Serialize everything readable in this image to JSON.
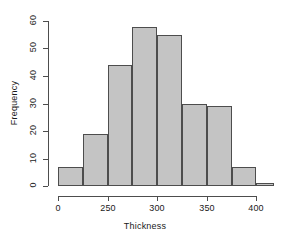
{
  "chart_data": {
    "type": "bar",
    "subtype": "histogram",
    "title": "",
    "xlabel": "Thickness",
    "ylabel": "Frequency",
    "xlim": [
      200,
      400
    ],
    "ylim": [
      0,
      60
    ],
    "xticks": [
      0,
      250,
      300,
      350,
      400
    ],
    "xtick_positions": [
      200,
      250,
      300,
      350,
      400
    ],
    "yticks": [
      0,
      10,
      20,
      30,
      40,
      50,
      60
    ],
    "grid": false,
    "legend": null,
    "bin_width": 25,
    "bin_edges": [
      200,
      225,
      250,
      275,
      300,
      325,
      350,
      375,
      400
    ],
    "categories": [
      "200-225",
      "225-250",
      "250-275",
      "275-300",
      "300-325",
      "325-350",
      "350-375",
      "375-400"
    ],
    "values": [
      7,
      19,
      44,
      58,
      55,
      30,
      29,
      7
    ],
    "tail_bar": {
      "edge_start": 400,
      "edge_end": 418,
      "value": 1
    },
    "bar_fill": "#c4c4c4",
    "bar_stroke": "#4d4d4d",
    "axis_color": "#4d4d4d",
    "text_color": "#1a1a1a"
  },
  "axes": {
    "x_title": "Thickness",
    "y_title": "Frequency"
  },
  "ticks": {
    "x": [
      {
        "label": "0",
        "px": 58
      },
      {
        "label": "250",
        "px": 108
      },
      {
        "label": "300",
        "px": 157
      },
      {
        "label": "350",
        "px": 207
      },
      {
        "label": "400",
        "px": 256
      }
    ],
    "y": [
      {
        "label": "0",
        "px": 186
      },
      {
        "label": "10",
        "px": 159
      },
      {
        "label": "20",
        "px": 131
      },
      {
        "label": "30",
        "px": 104
      },
      {
        "label": "40",
        "px": 76
      },
      {
        "label": "50",
        "px": 48
      },
      {
        "label": "60",
        "px": 21
      }
    ]
  },
  "bars": [
    {
      "name": "bin-1",
      "x0": 58,
      "x1": 83,
      "value": 7
    },
    {
      "name": "bin-2",
      "x0": 83,
      "x1": 108,
      "value": 19
    },
    {
      "name": "bin-3",
      "x0": 108,
      "x1": 132,
      "value": 44
    },
    {
      "name": "bin-4",
      "x0": 132,
      "x1": 157,
      "value": 58
    },
    {
      "name": "bin-5",
      "x0": 157,
      "x1": 182,
      "value": 55
    },
    {
      "name": "bin-6",
      "x0": 182,
      "x1": 207,
      "value": 30
    },
    {
      "name": "bin-7",
      "x0": 207,
      "x1": 232,
      "value": 29
    },
    {
      "name": "bin-8",
      "x0": 232,
      "x1": 256,
      "value": 7
    },
    {
      "name": "bin-9",
      "x0": 256,
      "x1": 274,
      "value": 1
    }
  ]
}
